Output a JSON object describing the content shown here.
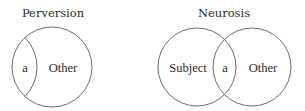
{
  "diagrams": [
    {
      "title": "Perversion",
      "labels": {
        "object": "a",
        "other": "Other"
      },
      "colors": {
        "stroke": "#5a5a5a",
        "text": "#2a2a2a"
      }
    },
    {
      "title": "Neurosis",
      "labels": {
        "subject": "Subject",
        "object": "a",
        "other": "Other"
      },
      "colors": {
        "stroke": "#5a5a5a",
        "text": "#2a2a2a"
      }
    }
  ]
}
